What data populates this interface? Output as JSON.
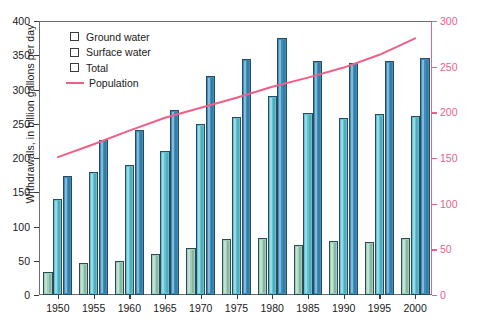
{
  "chart_data": {
    "type": "bar",
    "title": "",
    "subtitle": "",
    "xlabel": "",
    "ylabel": "Withdrawals, in billion gallons per day",
    "y2label": "Population, in millions",
    "categories": [
      "1950",
      "1955",
      "1960",
      "1965",
      "1970",
      "1975",
      "1980",
      "1985",
      "1990",
      "1995",
      "2000"
    ],
    "ylim": [
      0,
      400
    ],
    "y2lim": [
      0,
      300
    ],
    "yticks": [
      0,
      50,
      100,
      150,
      200,
      250,
      300,
      350,
      400
    ],
    "y2ticks": [
      0,
      50,
      100,
      150,
      200,
      250,
      300
    ],
    "grid": false,
    "legend_position": "upper-left",
    "series": [
      {
        "name": "Ground water",
        "color": "#9ecfb8",
        "axis": "left",
        "values": [
          34,
          47,
          50,
          60,
          68,
          82,
          83,
          73,
          79,
          77,
          83
        ]
      },
      {
        "name": "Surface water",
        "color": "#5ec3d4",
        "axis": "left",
        "values": [
          140,
          180,
          190,
          210,
          250,
          260,
          290,
          265,
          259,
          264,
          262
        ]
      },
      {
        "name": "Total",
        "color": "#3b8fbe",
        "axis": "left",
        "values": [
          174,
          227,
          241,
          270,
          319,
          345,
          375,
          341,
          339,
          341,
          346
        ]
      },
      {
        "name": "Population",
        "color": "#ef5f86",
        "axis": "right",
        "type": "line",
        "values": [
          151,
          165,
          180,
          194,
          205,
          216,
          228,
          238,
          249,
          263,
          281
        ]
      }
    ]
  },
  "legend": {
    "items": [
      {
        "label": "Ground water",
        "marker": "swatch"
      },
      {
        "label": "Surface water",
        "marker": "swatch"
      },
      {
        "label": "Total",
        "marker": "swatch"
      },
      {
        "label": "Population",
        "marker": "line"
      }
    ]
  },
  "colors": {
    "ground_water": "#9ecfb8",
    "surface_water": "#5ec3d4",
    "total": "#3b8fbe",
    "population": "#ef5f86",
    "axis": "#3b3b3b",
    "right_axis_text": "#e8628a"
  },
  "caption": ""
}
